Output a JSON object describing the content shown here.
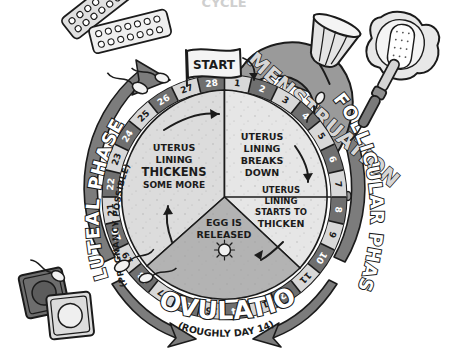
{
  "title_cut_off": "CYCLE",
  "diagram": {
    "name": "menstrual-cycle-wheel",
    "start_flag_label": "START",
    "phase_labels": {
      "menstruation": "MENSTRUATION",
      "follicular": "FOLLICULAR PHASE",
      "luteal_main": "LUTEAL PHASE",
      "luteal_sub": "(PREGNANCY POSSIBLE)",
      "ovulation_main": "OVULATION",
      "ovulation_sub": "(ROUGHLY DAY 14)"
    },
    "segments": [
      {
        "id": "menstruation-breaks-down",
        "lines": [
          "UTERUS",
          "LINING",
          "BREAKS",
          "DOWN"
        ],
        "emphasis": []
      },
      {
        "id": "follicular-starts-to-thicken",
        "lines": [
          "UTERUS",
          "LINING",
          "STARTS TO",
          "THICKEN"
        ],
        "emphasis": [
          "THICKEN"
        ]
      },
      {
        "id": "ovulation-egg-released",
        "lines": [
          "EGG IS",
          "RELEASED"
        ],
        "emphasis": []
      },
      {
        "id": "luteal-thickens-some-more",
        "lines": [
          "UTERUS",
          "LINING",
          "THICKENS",
          "SOME MORE"
        ],
        "emphasis": [
          "THICKENS"
        ]
      }
    ],
    "days": [
      1,
      2,
      3,
      4,
      5,
      6,
      7,
      8,
      9,
      10,
      11,
      12,
      13,
      14,
      15,
      16,
      17,
      18,
      19,
      20,
      21,
      22,
      23,
      24,
      25,
      26,
      27,
      28
    ],
    "day_count": 28
  },
  "objects": [
    {
      "name": "birth-control-pill-pack-1",
      "label": "birth control pill blister pack"
    },
    {
      "name": "birth-control-pill-pack-2",
      "label": "birth control pill blister pack"
    },
    {
      "name": "menstrual-cup",
      "label": "menstrual cup"
    },
    {
      "name": "sanitary-pad",
      "label": "sanitary pad"
    },
    {
      "name": "tampon-applicator",
      "label": "tampon with applicator"
    },
    {
      "name": "condom-packet-dark",
      "label": "condom packet"
    },
    {
      "name": "condom-packet-light",
      "label": "condom packet"
    },
    {
      "name": "sperm-cell",
      "label": "sperm cell"
    }
  ],
  "colors": {
    "ink": "#1b1b1b",
    "menstruation_blob": "#9a9a9a",
    "ring_dark": "#6f6f6f",
    "ring_light": "#d8d8d8",
    "wedge_light": "#dcdcdc",
    "wedge_mid": "#c6c6c6",
    "wedge_dark": "#a8a8a8",
    "arrow_gray": "#7c7c7c",
    "paper": "#ffffff"
  }
}
